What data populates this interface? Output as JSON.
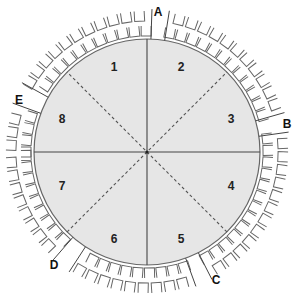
{
  "diagram": {
    "type": "circular-seating-plan",
    "center": [
      147,
      152
    ],
    "radius": 113,
    "fill_color": "#e6e6e6",
    "line_color": "#555555",
    "segments": [
      {
        "label": "1",
        "x": 114,
        "y": 68
      },
      {
        "label": "2",
        "x": 181,
        "y": 68
      },
      {
        "label": "3",
        "x": 231,
        "y": 120
      },
      {
        "label": "4",
        "x": 231,
        "y": 187
      },
      {
        "label": "5",
        "x": 181,
        "y": 240
      },
      {
        "label": "6",
        "x": 114,
        "y": 240
      },
      {
        "label": "7",
        "x": 62,
        "y": 187
      },
      {
        "label": "8",
        "x": 62,
        "y": 120
      }
    ],
    "entrances": [
      {
        "label": "A",
        "x": 158,
        "y": 13,
        "gap": [
          -88,
          -81
        ]
      },
      {
        "label": "B",
        "x": 287,
        "y": 125,
        "gap": [
          -16,
          -8
        ]
      },
      {
        "label": "C",
        "x": 216,
        "y": 281,
        "gap": [
          63,
          70
        ]
      },
      {
        "label": "D",
        "x": 54,
        "y": 266,
        "gap": [
          123,
          131
        ]
      },
      {
        "label": "E",
        "x": 19,
        "y": 101,
        "gap": [
          200,
          209
        ]
      }
    ],
    "seat_rows": [
      {
        "radius": 121,
        "size": 10
      },
      {
        "radius": 136,
        "size": 10
      }
    ],
    "seat_step_degrees": 5.6
  }
}
